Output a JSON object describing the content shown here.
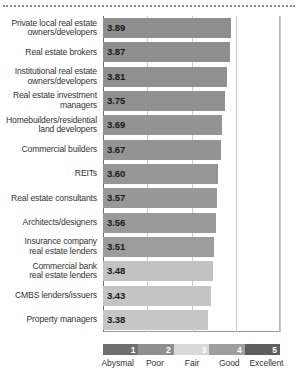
{
  "chart_data": {
    "type": "bar",
    "orientation": "horizontal",
    "title": "",
    "xlabel": "",
    "ylabel": "",
    "xlim": [
      1,
      5
    ],
    "grid": true,
    "gridlines": [
      1,
      2,
      3,
      4,
      5
    ],
    "tick_labels": [
      "1",
      "2",
      "3",
      "4",
      "5"
    ],
    "legend_position": "bottom",
    "categories": [
      "Private local real estate owners/developers",
      "Real estate brokers",
      "Institutional real estate owners/developers",
      "Real estate investment managers",
      "Homebuilders/residential land developers",
      "Commercial builders",
      "REITs",
      "Real estate consultants",
      "Architects/designers",
      "Insurance company real estate lenders",
      "Commercial bank real estate lenders",
      "CMBS lenders/issuers",
      "Property managers"
    ],
    "values": [
      3.89,
      3.87,
      3.81,
      3.75,
      3.69,
      3.67,
      3.6,
      3.57,
      3.56,
      3.51,
      3.48,
      3.43,
      3.38
    ],
    "value_labels": [
      "3.89",
      "3.87",
      "3.81",
      "3.75",
      "3.69",
      "3.67",
      "3.60",
      "3.57",
      "3.56",
      "3.51",
      "3.48",
      "3.43",
      "3.38"
    ],
    "bar_colors": [
      "#8f8f8f",
      "#8f8f8f",
      "#909090",
      "#919191",
      "#939393",
      "#949494",
      "#969696",
      "#989898",
      "#999999",
      "#9c9c9c",
      "#c2c2c2",
      "#c4c4c4",
      "#c6c6c6"
    ],
    "scale_legend": {
      "ticks": [
        "1",
        "2",
        "3",
        "4",
        "5"
      ],
      "labels": [
        "Abysmal",
        "Poor",
        "Fair",
        "Good",
        "Excellent"
      ],
      "colors": [
        "#707070",
        "#8f8f8f",
        "#d9d9d9",
        "#9e9e9e",
        "#5e5e5e"
      ],
      "tick_text_colors": [
        "#ffffff",
        "#ffffff",
        "#ffffff",
        "#ffffff",
        "#ffffff"
      ]
    }
  },
  "rows": [
    {
      "label_line1": "Private local real estate",
      "label_line2": "owners/developers",
      "value": "3.89"
    },
    {
      "label_line1": "Real estate brokers",
      "label_line2": "",
      "value": "3.87"
    },
    {
      "label_line1": "Institutional real estate",
      "label_line2": "owners/developers",
      "value": "3.81"
    },
    {
      "label_line1": "Real estate investment",
      "label_line2": "managers",
      "value": "3.75"
    },
    {
      "label_line1": "Homebuilders/residential",
      "label_line2": "land developers",
      "value": "3.69"
    },
    {
      "label_line1": "Commercial builders",
      "label_line2": "",
      "value": "3.67"
    },
    {
      "label_line1": "REITs",
      "label_line2": "",
      "value": "3.60"
    },
    {
      "label_line1": "Real estate consultants",
      "label_line2": "",
      "value": "3.57"
    },
    {
      "label_line1": "Architects/designers",
      "label_line2": "",
      "value": "3.56"
    },
    {
      "label_line1": "Insurance company",
      "label_line2": "real estate lenders",
      "value": "3.51"
    },
    {
      "label_line1": "Commercial bank",
      "label_line2": "real estate lenders",
      "value": "3.48"
    },
    {
      "label_line1": "CMBS lenders/issuers",
      "label_line2": "",
      "value": "3.43"
    },
    {
      "label_line1": "Property managers",
      "label_line2": "",
      "value": "3.38"
    }
  ]
}
